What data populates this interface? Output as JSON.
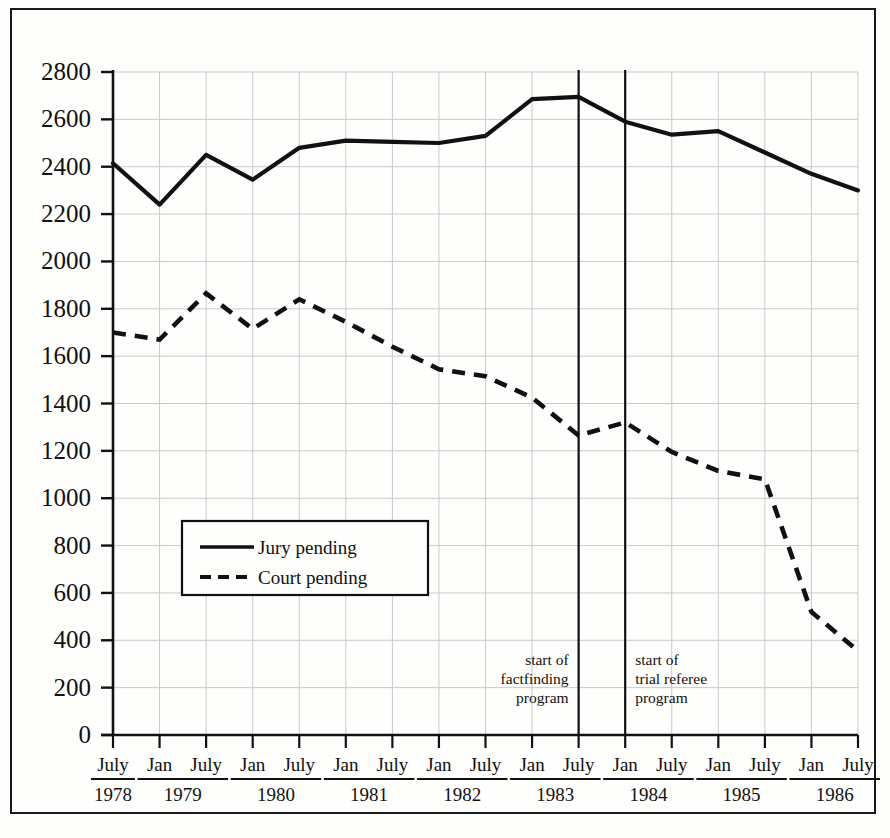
{
  "chart_data": {
    "type": "line",
    "title": "",
    "subtitle": "",
    "xlabel": "",
    "ylabel": "",
    "grid": true,
    "legend_position": "center-left",
    "ylim": [
      0,
      2800
    ],
    "yticks": [
      0,
      200,
      400,
      600,
      800,
      1000,
      1200,
      1400,
      1600,
      1800,
      2000,
      2200,
      2400,
      2600,
      2800
    ],
    "ytick_labels": [
      "0",
      "200",
      "400",
      "600",
      "800",
      "1000",
      "1200",
      "1400",
      "1600",
      "1800",
      "2000",
      "2200",
      "2400",
      "2600",
      "2800"
    ],
    "x": [
      "July 1978",
      "Jan 1979",
      "July 1979",
      "Jan 1980",
      "July 1980",
      "Jan 1981",
      "July 1981",
      "Jan 1982",
      "July 1982",
      "Jan 1983",
      "July 1983",
      "Jan 1984",
      "July 1984",
      "Jan 1985",
      "July 1985",
      "Jan 1986",
      "July 1986"
    ],
    "xtick_months": [
      "July",
      "Jan",
      "July",
      "Jan",
      "July",
      "Jan",
      "July",
      "Jan",
      "July",
      "Jan",
      "July",
      "Jan",
      "July",
      "Jan",
      "July",
      "Jan",
      "July"
    ],
    "year_groups": [
      {
        "label": "1978",
        "start_index": 0,
        "end_index": 0
      },
      {
        "label": "1979",
        "start_index": 1,
        "end_index": 2
      },
      {
        "label": "1980",
        "start_index": 3,
        "end_index": 4
      },
      {
        "label": "1981",
        "start_index": 5,
        "end_index": 6
      },
      {
        "label": "1982",
        "start_index": 7,
        "end_index": 8
      },
      {
        "label": "1983",
        "start_index": 9,
        "end_index": 10
      },
      {
        "label": "1984",
        "start_index": 11,
        "end_index": 12
      },
      {
        "label": "1985",
        "start_index": 13,
        "end_index": 14
      },
      {
        "label": "1986",
        "start_index": 15,
        "end_index": 16
      }
    ],
    "series": [
      {
        "name": "Jury pending",
        "style": "solid",
        "values": [
          2415,
          2240,
          2450,
          2345,
          2480,
          2510,
          2505,
          2500,
          2530,
          2685,
          2695,
          2590,
          2535,
          2550,
          2460,
          2370,
          2300
        ]
      },
      {
        "name": "Court pending",
        "style": "dashed",
        "values": [
          1700,
          1670,
          1865,
          1715,
          1840,
          1745,
          1640,
          1545,
          1515,
          1425,
          1265,
          1320,
          1195,
          1115,
          1080,
          520,
          355
        ]
      }
    ],
    "annotations": [
      {
        "id": "factfinding",
        "lines": [
          "start of",
          "factfinding",
          "program"
        ],
        "at_x": "July 1983",
        "align": "right"
      },
      {
        "id": "trial-referee",
        "lines": [
          "start of",
          "trial referee",
          "program"
        ],
        "at_x": "Jan 1984",
        "align": "left"
      }
    ],
    "event_markers": [
      {
        "label": "start of factfinding program",
        "at_x": "July 1983"
      },
      {
        "label": "start of trial referee program",
        "at_x": "Jan 1984"
      }
    ],
    "colors": {
      "line": "#111111",
      "grid": "#c9c9c9",
      "axis": "#111111",
      "background": "#fefefc"
    }
  },
  "legend": {
    "entries": [
      {
        "label": "Jury pending",
        "style": "solid"
      },
      {
        "label": "Court pending",
        "style": "dashed"
      }
    ]
  }
}
